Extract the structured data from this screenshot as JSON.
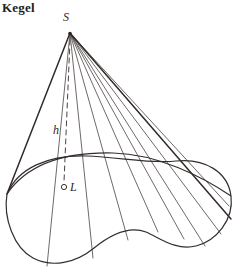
{
  "figure": {
    "title": "Kegel",
    "background_color": "#ffffff",
    "ink_color": "#3a3330",
    "labels": {
      "apex": "S",
      "height": "h",
      "center": "L"
    },
    "geometry": {
      "apex_point": {
        "x": 70,
        "y": 33
      },
      "center_point": {
        "x": 64,
        "y": 187
      },
      "axis_style": "dashed",
      "base_shape": "kidney-shaped closed curve",
      "generator_line_count": 11,
      "silhouette_edges": 2
    }
  }
}
